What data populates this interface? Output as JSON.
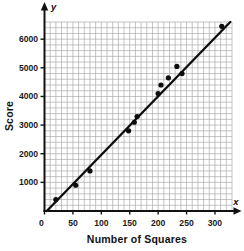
{
  "chart": {
    "xlabel": "Number of Squares",
    "ylabel": "Score",
    "x_axis_letter": "x",
    "y_axis_letter": "y",
    "origin_label": "0"
  },
  "chart_data": {
    "type": "scatter",
    "title": "",
    "xlabel": "Number of Squares",
    "ylabel": "Score",
    "xlim": [
      0,
      330
    ],
    "ylim": [
      0,
      6600
    ],
    "x_ticks": [
      0,
      50,
      100,
      150,
      200,
      250,
      300
    ],
    "y_ticks": [
      1000,
      2000,
      3000,
      4000,
      5000,
      6000
    ],
    "grid": true,
    "grid_step_x": 10,
    "grid_step_y": 200,
    "points": [
      [
        20,
        400
      ],
      [
        55,
        900
      ],
      [
        80,
        1400
      ],
      [
        148,
        2800
      ],
      [
        158,
        3100
      ],
      [
        163,
        3300
      ],
      [
        200,
        4100
      ],
      [
        205,
        4400
      ],
      [
        218,
        4650
      ],
      [
        233,
        5050
      ],
      [
        242,
        4800
      ],
      [
        312,
        6450
      ]
    ],
    "trend_line": {
      "x1": 4,
      "y1": 0,
      "x2": 327,
      "y2": 6600
    },
    "colors": {
      "grid": "#a6a6a6",
      "axis": "#111111",
      "point": "#0d0d0d",
      "line": "#0d0d0d",
      "background": "#ffffff"
    }
  }
}
